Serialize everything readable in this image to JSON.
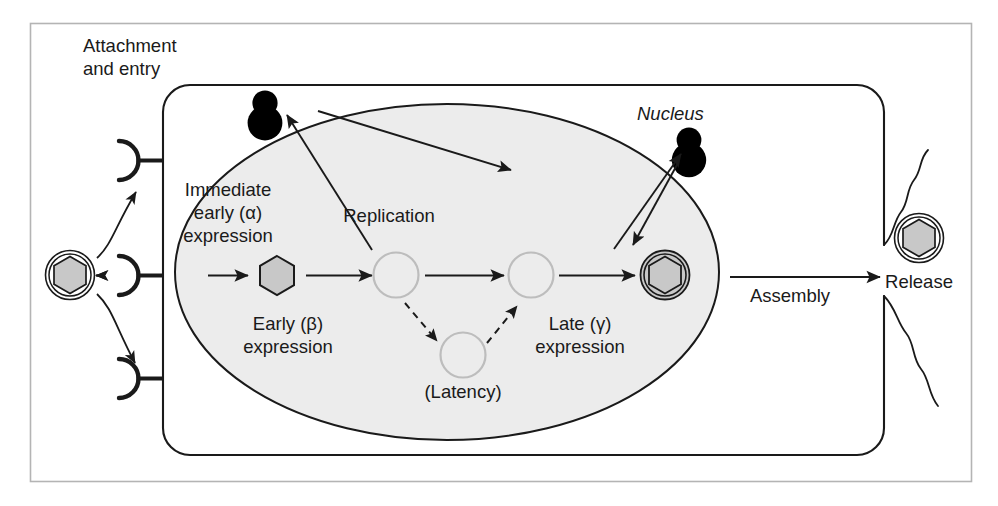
{
  "figure": {
    "background_color": "#ffffff",
    "frame_color": "#b4b4b4",
    "stroke_color": "#1a1a1a",
    "nucleus_fill": "#ececec",
    "capsid_fill": "#c8c8c8",
    "faint_circle_color": "#bdbdbd"
  },
  "labels": {
    "attachment_line1": "Attachment",
    "attachment_line2": "and entry",
    "immediate_early_line1": "Immediate",
    "immediate_early_line2": "early (α)",
    "immediate_early_line3": "expression",
    "early_line1": "Early (β)",
    "early_line2": "expression",
    "replication": "Replication",
    "latency": "(Latency)",
    "late_line1": "Late (γ)",
    "late_line2": "expression",
    "nucleus": "Nucleus",
    "assembly": "Assembly",
    "release": "Release"
  },
  "stages": [
    {
      "id": "attachment",
      "label": "Attachment and entry"
    },
    {
      "id": "immediate-early",
      "label": "Immediate early (α) expression"
    },
    {
      "id": "early",
      "label": "Early (β) expression"
    },
    {
      "id": "replication",
      "label": "Replication"
    },
    {
      "id": "latency",
      "label": "(Latency)"
    },
    {
      "id": "late",
      "label": "Late (γ) expression"
    },
    {
      "id": "assembly",
      "label": "Assembly"
    },
    {
      "id": "release",
      "label": "Release"
    }
  ],
  "structures": {
    "cell_membrane": "cell-membrane",
    "nucleus": "nucleus",
    "receptors_count": 3,
    "virion_external": "enveloped-virion",
    "virion_assembled": "enveloped-virion",
    "virion_released": "enveloped-virion",
    "capsid_naked": "naked-capsid-hexagon",
    "glycoprotein_blobs": 2
  }
}
